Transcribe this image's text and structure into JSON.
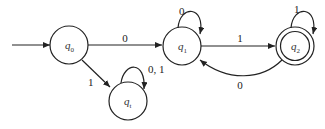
{
  "diagram": {
    "type": "finite-automaton",
    "start_state": "q0",
    "accept_states": [
      "q2"
    ],
    "states": [
      {
        "id": "q0",
        "base": "q",
        "sub": "0",
        "accepting": false
      },
      {
        "id": "q1",
        "base": "q",
        "sub": "1",
        "accepting": false
      },
      {
        "id": "q2",
        "base": "q",
        "sub": "2",
        "accepting": true
      },
      {
        "id": "qt",
        "base": "q",
        "sub": "t",
        "accepting": false
      }
    ],
    "transitions": [
      {
        "from": "q0",
        "to": "q1",
        "label": "0"
      },
      {
        "from": "q0",
        "to": "qt",
        "label": "1"
      },
      {
        "from": "qt",
        "to": "qt",
        "label": "0, 1"
      },
      {
        "from": "q1",
        "to": "q1",
        "label": "0"
      },
      {
        "from": "q1",
        "to": "q2",
        "label": "1"
      },
      {
        "from": "q2",
        "to": "q2",
        "label": "1"
      },
      {
        "from": "q2",
        "to": "q1",
        "label": "0"
      }
    ],
    "colors": {
      "stroke": "#222222",
      "background": "#ffffff"
    }
  }
}
